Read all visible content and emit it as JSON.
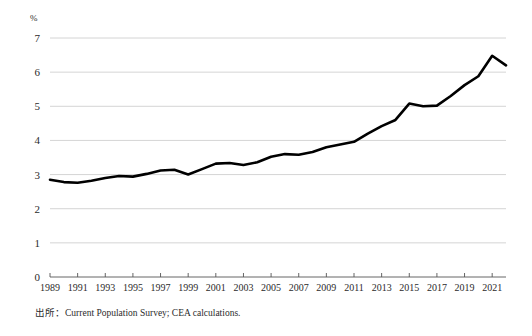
{
  "figure": {
    "unit_label": "%",
    "source_note": "出所：Current Population Survey; CEA calculations."
  },
  "chart_data": {
    "type": "line",
    "title": "",
    "subtitle": "",
    "xlabel": "",
    "ylabel": "%",
    "ylim": [
      0,
      7
    ],
    "xlim": [
      1989,
      2022
    ],
    "grid": "horizontal",
    "legend": "none",
    "ytick_labels": [
      "0",
      "1",
      "2",
      "3",
      "4",
      "5",
      "6",
      "7"
    ],
    "ytick_values": [
      0,
      1,
      2,
      3,
      4,
      5,
      6,
      7
    ],
    "xtick_labels": [
      "1989",
      "1991",
      "1993",
      "1995",
      "1997",
      "1999",
      "2001",
      "2003",
      "2005",
      "2007",
      "2009",
      "2011",
      "2013",
      "2015",
      "2017",
      "2019",
      "2021"
    ],
    "xtick_values": [
      1989,
      1991,
      1993,
      1995,
      1997,
      1999,
      2001,
      2003,
      2005,
      2007,
      2009,
      2011,
      2013,
      2015,
      2017,
      2019,
      2021
    ],
    "series": [
      {
        "name": "share",
        "color": "#000000",
        "x": [
          1989,
          1990,
          1991,
          1992,
          1993,
          1994,
          1995,
          1996,
          1997,
          1998,
          1999,
          2000,
          2001,
          2002,
          2003,
          2004,
          2005,
          2006,
          2007,
          2008,
          2009,
          2010,
          2011,
          2012,
          2013,
          2014,
          2015,
          2016,
          2017,
          2018,
          2019,
          2020,
          2021,
          2022
        ],
        "values": [
          2.85,
          2.78,
          2.76,
          2.82,
          2.9,
          2.96,
          2.94,
          3.02,
          3.12,
          3.14,
          3.0,
          3.16,
          3.32,
          3.34,
          3.28,
          3.36,
          3.52,
          3.6,
          3.58,
          3.66,
          3.8,
          3.88,
          3.96,
          4.2,
          4.42,
          4.6,
          5.08,
          5.0,
          5.02,
          5.3,
          5.62,
          5.88,
          6.48,
          6.2
        ]
      }
    ]
  }
}
